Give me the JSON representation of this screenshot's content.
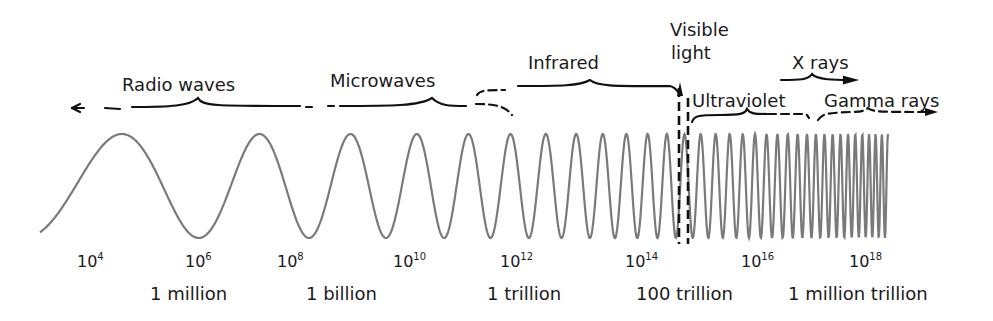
{
  "diagram": {
    "wave_color": "#7a7a7a",
    "ink_color": "#111111",
    "wave": {
      "x_start": 40,
      "x_end": 888,
      "y_center": 186,
      "amplitude": 52
    },
    "bands": [
      {
        "id": "radio",
        "label": "Radio waves",
        "x": 122,
        "y": 75
      },
      {
        "id": "microwave",
        "label": "Microwaves",
        "x": 330,
        "y": 71
      },
      {
        "id": "infrared",
        "label": "Infrared",
        "x": 528,
        "y": 53
      },
      {
        "id": "visible",
        "label": "Visible light",
        "line1": "Visible",
        "line2": "light",
        "x": 670,
        "y": 20
      },
      {
        "id": "ultraviolet",
        "label": "Ultraviolet",
        "x": 692,
        "y": 91
      },
      {
        "id": "xray",
        "label": "X rays",
        "x": 792,
        "y": 53
      },
      {
        "id": "gamma",
        "label": "Gamma rays",
        "x": 824,
        "y": 91
      }
    ],
    "exponent_ticks": [
      {
        "base": "10",
        "exp": "4",
        "x": 77
      },
      {
        "base": "10",
        "exp": "6",
        "x": 185
      },
      {
        "base": "10",
        "exp": "8",
        "x": 277
      },
      {
        "base": "10",
        "exp": "10",
        "x": 393
      },
      {
        "base": "10",
        "exp": "12",
        "x": 500
      },
      {
        "base": "10",
        "exp": "14",
        "x": 625
      },
      {
        "base": "10",
        "exp": "16",
        "x": 741
      },
      {
        "base": "10",
        "exp": "18",
        "x": 849
      }
    ],
    "frequency_labels": [
      {
        "text": "1 million",
        "x": 150
      },
      {
        "text": "1 billion",
        "x": 306
      },
      {
        "text": "1 trillion",
        "x": 487
      },
      {
        "text": "100 trillion",
        "x": 636
      },
      {
        "text": "1 million trillion",
        "x": 788
      }
    ]
  }
}
